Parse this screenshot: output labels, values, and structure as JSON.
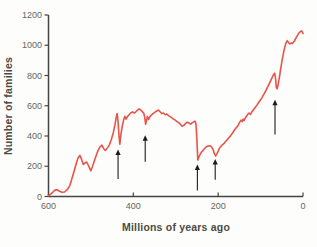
{
  "figure": {
    "background": "#fdfdfb"
  },
  "colors": {
    "curve": "#e8544a",
    "axis": "#454545",
    "tick_text": "#66655f",
    "title_text": "#4c4b45",
    "arrow": "#1c1c1c"
  },
  "chart_data": {
    "type": "line",
    "title": "",
    "xlabel": "Millions of years ago",
    "ylabel": "Number of families",
    "grid": false,
    "legend": false,
    "x_axis": {
      "min": 600,
      "max": 0,
      "direction": "reversed",
      "ticks": [
        600,
        400,
        200,
        0
      ]
    },
    "y_axis": {
      "min": 0,
      "max": 1200,
      "ticks": [
        0,
        200,
        400,
        600,
        800,
        1000,
        1200
      ]
    },
    "series": [
      {
        "name": "Number of families",
        "color": "#e8544a",
        "points": [
          [
            600,
            5
          ],
          [
            595,
            15
          ],
          [
            590,
            28
          ],
          [
            585,
            42
          ],
          [
            580,
            45
          ],
          [
            574,
            35
          ],
          [
            568,
            28
          ],
          [
            562,
            30
          ],
          [
            556,
            45
          ],
          [
            550,
            70
          ],
          [
            545,
            115
          ],
          [
            540,
            165
          ],
          [
            535,
            215
          ],
          [
            530,
            258
          ],
          [
            526,
            272
          ],
          [
            522,
            245
          ],
          [
            518,
            212
          ],
          [
            514,
            222
          ],
          [
            510,
            228
          ],
          [
            506,
            205
          ],
          [
            503,
            188
          ],
          [
            500,
            170
          ],
          [
            496,
            200
          ],
          [
            492,
            235
          ],
          [
            488,
            268
          ],
          [
            483,
            305
          ],
          [
            478,
            330
          ],
          [
            474,
            340
          ],
          [
            470,
            318
          ],
          [
            466,
            305
          ],
          [
            462,
            318
          ],
          [
            457,
            340
          ],
          [
            452,
            375
          ],
          [
            447,
            425
          ],
          [
            443,
            478
          ],
          [
            440,
            530
          ],
          [
            438,
            548
          ],
          [
            436,
            490
          ],
          [
            434,
            410
          ],
          [
            432,
            345
          ],
          [
            429,
            415
          ],
          [
            426,
            465
          ],
          [
            423,
            505
          ],
          [
            420,
            530
          ],
          [
            417,
            512
          ],
          [
            414,
            528
          ],
          [
            410,
            540
          ],
          [
            406,
            552
          ],
          [
            402,
            560
          ],
          [
            398,
            552
          ],
          [
            394,
            560
          ],
          [
            390,
            572
          ],
          [
            386,
            580
          ],
          [
            382,
            570
          ],
          [
            378,
            558
          ],
          [
            375,
            548
          ],
          [
            373,
            520
          ],
          [
            371,
            478
          ],
          [
            369,
            500
          ],
          [
            367,
            528
          ],
          [
            364,
            510
          ],
          [
            361,
            528
          ],
          [
            357,
            540
          ],
          [
            353,
            550
          ],
          [
            349,
            558
          ],
          [
            345,
            565
          ],
          [
            341,
            572
          ],
          [
            337,
            560
          ],
          [
            333,
            548
          ],
          [
            329,
            552
          ],
          [
            325,
            540
          ],
          [
            321,
            545
          ],
          [
            317,
            535
          ],
          [
            313,
            528
          ],
          [
            309,
            520
          ],
          [
            305,
            512
          ],
          [
            301,
            505
          ],
          [
            297,
            495
          ],
          [
            293,
            488
          ],
          [
            289,
            478
          ],
          [
            285,
            465
          ],
          [
            281,
            470
          ],
          [
            277,
            482
          ],
          [
            273,
            492
          ],
          [
            269,
            486
          ],
          [
            265,
            478
          ],
          [
            261,
            488
          ],
          [
            257,
            495
          ],
          [
            254,
            498
          ],
          [
            252,
            470
          ],
          [
            250,
            360
          ],
          [
            248,
            242
          ],
          [
            246,
            258
          ],
          [
            243,
            275
          ],
          [
            240,
            290
          ],
          [
            236,
            305
          ],
          [
            232,
            318
          ],
          [
            228,
            328
          ],
          [
            224,
            334
          ],
          [
            220,
            336
          ],
          [
            216,
            330
          ],
          [
            212,
            310
          ],
          [
            209,
            285
          ],
          [
            206,
            268
          ],
          [
            203,
            282
          ],
          [
            200,
            300
          ],
          [
            197,
            318
          ],
          [
            194,
            330
          ],
          [
            190,
            342
          ],
          [
            186,
            352
          ],
          [
            182,
            365
          ],
          [
            178,
            378
          ],
          [
            174,
            390
          ],
          [
            170,
            405
          ],
          [
            166,
            420
          ],
          [
            162,
            438
          ],
          [
            158,
            452
          ],
          [
            155,
            462
          ],
          [
            152,
            475
          ],
          [
            149,
            492
          ],
          [
            146,
            505
          ],
          [
            143,
            495
          ],
          [
            141,
            512
          ],
          [
            139,
            502
          ],
          [
            136,
            518
          ],
          [
            133,
            532
          ],
          [
            130,
            545
          ],
          [
            127,
            552
          ],
          [
            124,
            542
          ],
          [
            121,
            558
          ],
          [
            118,
            568
          ],
          [
            115,
            580
          ],
          [
            112,
            592
          ],
          [
            109,
            602
          ],
          [
            106,
            615
          ],
          [
            103,
            628
          ],
          [
            100,
            640
          ],
          [
            97,
            652
          ],
          [
            94,
            668
          ],
          [
            91,
            682
          ],
          [
            88,
            698
          ],
          [
            85,
            715
          ],
          [
            82,
            732
          ],
          [
            79,
            750
          ],
          [
            76,
            768
          ],
          [
            73,
            785
          ],
          [
            71,
            798
          ],
          [
            69,
            808
          ],
          [
            67,
            815
          ],
          [
            65,
            790
          ],
          [
            63,
            722
          ],
          [
            61,
            712
          ],
          [
            59,
            735
          ],
          [
            57,
            768
          ],
          [
            55,
            800
          ],
          [
            53,
            838
          ],
          [
            51,
            872
          ],
          [
            49,
            905
          ],
          [
            47,
            935
          ],
          [
            45,
            962
          ],
          [
            43,
            988
          ],
          [
            41,
            1008
          ],
          [
            39,
            1022
          ],
          [
            37,
            1030
          ],
          [
            35,
            1022
          ],
          [
            33,
            1014
          ],
          [
            31,
            1008
          ],
          [
            29,
            1012
          ],
          [
            27,
            1015
          ],
          [
            25,
            1012
          ],
          [
            23,
            1018
          ],
          [
            21,
            1025
          ],
          [
            19,
            1035
          ],
          [
            17,
            1046
          ],
          [
            15,
            1055
          ],
          [
            13,
            1065
          ],
          [
            11,
            1075
          ],
          [
            9,
            1082
          ],
          [
            7,
            1088
          ],
          [
            5,
            1092
          ],
          [
            3,
            1095
          ],
          [
            1,
            1085
          ],
          [
            0,
            1078
          ]
        ]
      }
    ],
    "extinction_markers": [
      {
        "ma": 436,
        "tip_families": 310,
        "tail_families": 115
      },
      {
        "ma": 372,
        "tip_families": 405,
        "tail_families": 230
      },
      {
        "ma": 249,
        "tip_families": 212,
        "tail_families": 40
      },
      {
        "ma": 207,
        "tip_families": 248,
        "tail_families": 110
      },
      {
        "ma": 66,
        "tip_families": 640,
        "tail_families": 410
      }
    ]
  }
}
